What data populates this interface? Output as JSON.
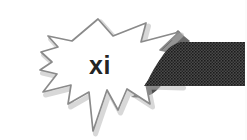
{
  "page": {
    "width": 247,
    "height": 140,
    "background_color": "#ffffff"
  },
  "folio": {
    "label": "xi",
    "text_color": "#242424",
    "font_size_px": 25
  },
  "burst": {
    "name": "starburst-callout",
    "fill_color": "#ffffff",
    "stroke_color": "#8a8a8a",
    "stroke_width": 1.6,
    "shadow_color": "#9a9a9a"
  },
  "banner": {
    "name": "halftone-banner",
    "fill_color": "#3c3c3c",
    "halftone_dot_color": "#1e1e1e",
    "halftone_gap_color": "#555555",
    "top_y": 42,
    "bottom_y": 86,
    "right_edge_x": 245
  },
  "icons": {
    "starburst": "starburst-icon",
    "banner": "banner-icon"
  }
}
